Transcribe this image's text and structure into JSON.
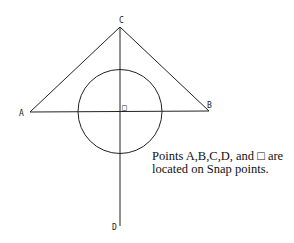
{
  "diagram": {
    "points": {
      "A": {
        "label": "A",
        "x": 30,
        "y": 112
      },
      "B": {
        "label": "B",
        "x": 209,
        "y": 111
      },
      "C": {
        "label": "C",
        "x": 120,
        "y": 27
      },
      "D": {
        "label": "D",
        "x": 120,
        "y": 226
      },
      "O": {
        "label": "□",
        "x": 120,
        "y": 112
      }
    },
    "circle": {
      "cx": 120,
      "cy": 111.5,
      "r": 42
    },
    "stroke_color": "#222222"
  },
  "caption": {
    "line1": "Points A,B,C,D, and □ are",
    "line2": "located on Snap points."
  }
}
